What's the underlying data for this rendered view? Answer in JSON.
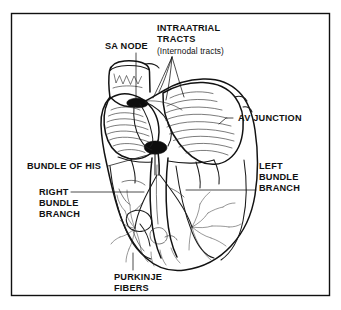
{
  "figure": {
    "background_color": "#ffffff",
    "ink_color": "#121212",
    "frame": {
      "stroke_color": "#101010",
      "x": 11,
      "y": 13,
      "width": 319,
      "height": 283
    }
  },
  "labels": {
    "sa_node": "SA NODE",
    "intraatrial_line1": "INTRAATRIAL",
    "intraatrial_line2": "TRACTS",
    "intraatrial_line3": "(Internodal tracts)",
    "av_junction": "AV JUNCTION",
    "bundle_of_his": "BUNDLE OF HIS",
    "right_bundle_line1": "RIGHT",
    "right_bundle_line2": "BUNDLE",
    "right_bundle_line3": "BRANCH",
    "left_bundle_line1": "LEFT",
    "left_bundle_line2": "BUNDLE",
    "left_bundle_line3": "BRANCH",
    "purkinje_line1": "PURKINJE",
    "purkinje_line2": "FIBERS"
  }
}
